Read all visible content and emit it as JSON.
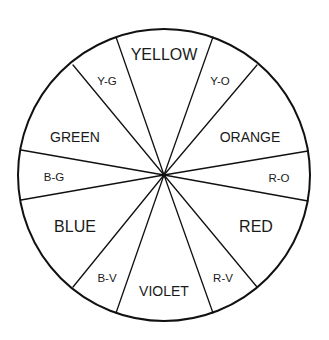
{
  "diagram": {
    "center": {
      "x": 164,
      "y": 175
    },
    "radius": 146,
    "stroke_color": "#111111",
    "background": "#ffffff",
    "segments": [
      {
        "id": "yellow",
        "label": "YELLOW",
        "tier": "primary",
        "x": 164,
        "y": 60
      },
      {
        "id": "y-o",
        "label": "Y-O",
        "tier": "tertiary",
        "x": 220,
        "y": 85
      },
      {
        "id": "orange",
        "label": "ORANGE",
        "tier": "secondary",
        "x": 250,
        "y": 142
      },
      {
        "id": "r-o",
        "label": "R-O",
        "tier": "tertiary",
        "x": 279,
        "y": 182
      },
      {
        "id": "red",
        "label": "RED",
        "tier": "primary",
        "x": 256,
        "y": 232
      },
      {
        "id": "r-v",
        "label": "R-V",
        "tier": "tertiary",
        "x": 223,
        "y": 282
      },
      {
        "id": "violet",
        "label": "VIOLET",
        "tier": "secondary",
        "x": 164,
        "y": 296
      },
      {
        "id": "b-v",
        "label": "B-V",
        "tier": "tertiary",
        "x": 107,
        "y": 282
      },
      {
        "id": "blue",
        "label": "BLUE",
        "tier": "primary",
        "x": 75,
        "y": 232
      },
      {
        "id": "b-g",
        "label": "B-G",
        "tier": "tertiary",
        "x": 54,
        "y": 181
      },
      {
        "id": "green",
        "label": "GREEN",
        "tier": "secondary",
        "x": 75,
        "y": 142
      },
      {
        "id": "y-g",
        "label": "Y-G",
        "tier": "tertiary",
        "x": 107,
        "y": 85
      }
    ],
    "spokes": [
      {
        "between": "yellow|y-g",
        "x2": 116,
        "y2": 37
      },
      {
        "between": "yellow|y-o",
        "x2": 213,
        "y2": 37
      },
      {
        "between": "y-o|orange",
        "x2": 257,
        "y2": 65
      },
      {
        "between": "orange|r-o",
        "x2": 308,
        "y2": 151
      },
      {
        "between": "r-o|red",
        "x2": 308,
        "y2": 201
      },
      {
        "between": "red|r-v",
        "x2": 257,
        "y2": 287
      },
      {
        "between": "r-v|violet",
        "x2": 213,
        "y2": 313
      },
      {
        "between": "violet|b-v",
        "x2": 116,
        "y2": 313
      },
      {
        "between": "b-v|blue",
        "x2": 73,
        "y2": 287
      },
      {
        "between": "blue|b-g",
        "x2": 21,
        "y2": 200
      },
      {
        "between": "b-g|green",
        "x2": 21,
        "y2": 150
      },
      {
        "between": "green|y-g",
        "x2": 73,
        "y2": 65
      }
    ]
  }
}
